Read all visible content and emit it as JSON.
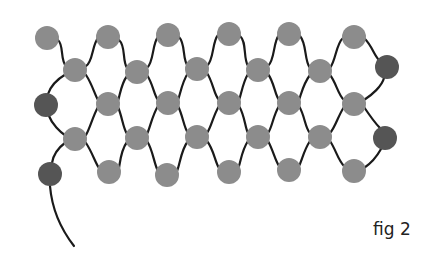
{
  "figure": {
    "caption": "fig 2"
  },
  "colors": {
    "bead_light": "#8c8c8c",
    "bead_dark": "#555555",
    "thread": "#1a1a1a",
    "background": "#ffffff"
  },
  "bead_radius": 12,
  "beads": [
    {
      "x": 47,
      "y": 38,
      "tone": "light"
    },
    {
      "x": 108,
      "y": 37,
      "tone": "light"
    },
    {
      "x": 168,
      "y": 35,
      "tone": "light"
    },
    {
      "x": 229,
      "y": 34,
      "tone": "light"
    },
    {
      "x": 289,
      "y": 34,
      "tone": "light"
    },
    {
      "x": 354,
      "y": 37,
      "tone": "light"
    },
    {
      "x": 75,
      "y": 70,
      "tone": "light"
    },
    {
      "x": 137,
      "y": 72,
      "tone": "light"
    },
    {
      "x": 197,
      "y": 69,
      "tone": "light"
    },
    {
      "x": 258,
      "y": 70,
      "tone": "light"
    },
    {
      "x": 320,
      "y": 71,
      "tone": "light"
    },
    {
      "x": 387,
      "y": 67,
      "tone": "dark"
    },
    {
      "x": 46,
      "y": 105,
      "tone": "dark"
    },
    {
      "x": 108,
      "y": 104,
      "tone": "light"
    },
    {
      "x": 168,
      "y": 103,
      "tone": "light"
    },
    {
      "x": 229,
      "y": 103,
      "tone": "light"
    },
    {
      "x": 289,
      "y": 103,
      "tone": "light"
    },
    {
      "x": 354,
      "y": 104,
      "tone": "light"
    },
    {
      "x": 75,
      "y": 139,
      "tone": "light"
    },
    {
      "x": 137,
      "y": 138,
      "tone": "light"
    },
    {
      "x": 197,
      "y": 137,
      "tone": "light"
    },
    {
      "x": 258,
      "y": 137,
      "tone": "light"
    },
    {
      "x": 320,
      "y": 137,
      "tone": "light"
    },
    {
      "x": 385,
      "y": 138,
      "tone": "dark"
    },
    {
      "x": 50,
      "y": 174,
      "tone": "dark"
    },
    {
      "x": 109,
      "y": 172,
      "tone": "light"
    },
    {
      "x": 167,
      "y": 175,
      "tone": "light"
    },
    {
      "x": 229,
      "y": 172,
      "tone": "light"
    },
    {
      "x": 289,
      "y": 170,
      "tone": "light"
    },
    {
      "x": 354,
      "y": 171,
      "tone": "light"
    }
  ],
  "threads": [
    "M58 40 C64 45, 60 60, 66 66",
    "M86 66 C93 62, 92 45, 98 38",
    "M119 40 C126 46, 122 60, 127 68",
    "M147 68 C154 62, 152 44, 158 37",
    "M179 37 C186 44, 182 60, 188 66",
    "M207 66 C214 60, 212 42, 218 35",
    "M240 36 C247 42, 243 58, 248 66",
    "M268 66 C275 60, 273 42, 279 35",
    "M300 36 C307 44, 304 60, 310 68",
    "M330 68 C336 60, 336 44, 343 38",
    "M365 39 C372 46, 374 55, 379 60",
    "M66 74 C56 80, 50 88, 48 94",
    "M86 75 C92 84, 95 95, 98 100",
    "M127 76 C121 84, 120 95, 118 101",
    "M147 75 C153 84, 154 95, 158 100",
    "M188 73 C182 82, 180 95, 178 100",
    "M207 73 C213 82, 214 95, 219 100",
    "M248 74 C243 82, 241 95, 239 100",
    "M268 74 C274 82, 275 95, 279 100",
    "M310 75 C303 84, 301 95, 299 100",
    "M330 75 C336 82, 338 95, 344 100",
    "M384 78 C382 86, 372 95, 364 100",
    "M49 116 C52 124, 60 132, 66 136",
    "M98 107 C93 116, 90 128, 86 135",
    "M118 107 C122 116, 123 128, 127 134",
    "M158 106 C152 116, 150 128, 147 134",
    "M178 106 C183 116, 184 128, 188 133",
    "M219 106 C213 116, 211 128, 207 133",
    "M239 106 C245 116, 245 128, 248 133",
    "M279 106 C273 116, 272 128, 268 133",
    "M299 106 C305 116, 305 128, 310 133",
    "M344 107 C338 116, 335 128, 330 133",
    "M364 107 C370 116, 376 124, 380 128",
    "M66 142 C58 148, 53 156, 52 163",
    "M86 143 C92 152, 95 162, 99 168",
    "M127 142 C121 150, 120 162, 119 168",
    "M147 141 C153 150, 154 164, 158 171",
    "M188 141 C181 150, 180 164, 177 171",
    "M207 141 C214 150, 215 162, 219 168",
    "M248 141 C242 150, 241 160, 239 166",
    "M268 141 C273 150, 275 160, 279 166",
    "M310 141 C304 150, 302 160, 299 166",
    "M330 141 C336 150, 338 160, 344 166",
    "M381 149 C376 158, 370 164, 364 168",
    "M50 186 C52 210, 60 228, 74 246"
  ]
}
